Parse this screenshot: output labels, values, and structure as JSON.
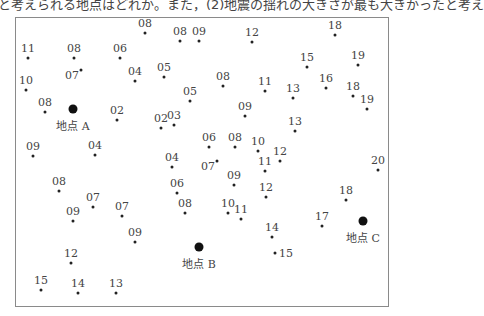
{
  "caption": "と考えられる地点はどれか。また，(2)地震の揺れの大きさが最も大きかったと考え",
  "map": {
    "frame": {
      "left": 15,
      "top": 17,
      "right": 389,
      "bottom": 307
    },
    "sites": [
      {
        "name": "地点 A",
        "x": 73,
        "y": 109
      },
      {
        "name": "地点 B",
        "x": 199,
        "y": 247
      },
      {
        "name": "地点 C",
        "x": 363,
        "y": 221
      }
    ],
    "points": [
      {
        "v": "08",
        "x": 145,
        "y": 33
      },
      {
        "v": "08",
        "x": 180,
        "y": 41
      },
      {
        "v": "09",
        "x": 199,
        "y": 41
      },
      {
        "v": "12",
        "x": 252,
        "y": 42
      },
      {
        "v": "18",
        "x": 335,
        "y": 35
      },
      {
        "v": "11",
        "x": 28,
        "y": 58
      },
      {
        "v": "08",
        "x": 74,
        "y": 58
      },
      {
        "v": "06",
        "x": 120,
        "y": 58
      },
      {
        "v": "07",
        "x": 81,
        "y": 70,
        "pos": "left"
      },
      {
        "v": "04",
        "x": 135,
        "y": 81
      },
      {
        "v": "05",
        "x": 164,
        "y": 77
      },
      {
        "v": "15",
        "x": 307,
        "y": 67
      },
      {
        "v": "19",
        "x": 358,
        "y": 65
      },
      {
        "v": "10",
        "x": 26,
        "y": 90
      },
      {
        "v": "08",
        "x": 223,
        "y": 86
      },
      {
        "v": "11",
        "x": 265,
        "y": 91
      },
      {
        "v": "16",
        "x": 326,
        "y": 88
      },
      {
        "v": "13",
        "x": 293,
        "y": 98
      },
      {
        "v": "18",
        "x": 353,
        "y": 96
      },
      {
        "v": "05",
        "x": 190,
        "y": 101
      },
      {
        "v": "19",
        "x": 367,
        "y": 109
      },
      {
        "v": "08",
        "x": 45,
        "y": 112
      },
      {
        "v": "02",
        "x": 117,
        "y": 120
      },
      {
        "v": "09",
        "x": 245,
        "y": 116
      },
      {
        "v": "02",
        "x": 161,
        "y": 128
      },
      {
        "v": "03",
        "x": 174,
        "y": 125
      },
      {
        "v": "13",
        "x": 295,
        "y": 131
      },
      {
        "v": "09",
        "x": 33,
        "y": 156
      },
      {
        "v": "04",
        "x": 95,
        "y": 155
      },
      {
        "v": "06",
        "x": 209,
        "y": 147
      },
      {
        "v": "08",
        "x": 235,
        "y": 147
      },
      {
        "v": "10",
        "x": 258,
        "y": 151
      },
      {
        "v": "12",
        "x": 280,
        "y": 161
      },
      {
        "v": "11",
        "x": 265,
        "y": 171
      },
      {
        "v": "20",
        "x": 378,
        "y": 170
      },
      {
        "v": "04",
        "x": 172,
        "y": 167
      },
      {
        "v": "07",
        "x": 217,
        "y": 161,
        "pos": "left"
      },
      {
        "v": "09",
        "x": 234,
        "y": 185
      },
      {
        "v": "08",
        "x": 59,
        "y": 191
      },
      {
        "v": "06",
        "x": 177,
        "y": 193
      },
      {
        "v": "12",
        "x": 266,
        "y": 197
      },
      {
        "v": "18",
        "x": 346,
        "y": 200
      },
      {
        "v": "07",
        "x": 93,
        "y": 207
      },
      {
        "v": "07",
        "x": 122,
        "y": 216
      },
      {
        "v": "09",
        "x": 73,
        "y": 221
      },
      {
        "v": "08",
        "x": 185,
        "y": 213
      },
      {
        "v": "10",
        "x": 228,
        "y": 213
      },
      {
        "v": "11",
        "x": 241,
        "y": 219
      },
      {
        "v": "17",
        "x": 322,
        "y": 226
      },
      {
        "v": "09",
        "x": 135,
        "y": 242
      },
      {
        "v": "14",
        "x": 272,
        "y": 237
      },
      {
        "v": "15",
        "x": 275,
        "y": 253,
        "pos": "right"
      },
      {
        "v": "12",
        "x": 71,
        "y": 263
      },
      {
        "v": "15",
        "x": 41,
        "y": 290
      },
      {
        "v": "14",
        "x": 78,
        "y": 293
      },
      {
        "v": "13",
        "x": 116,
        "y": 293
      }
    ]
  }
}
